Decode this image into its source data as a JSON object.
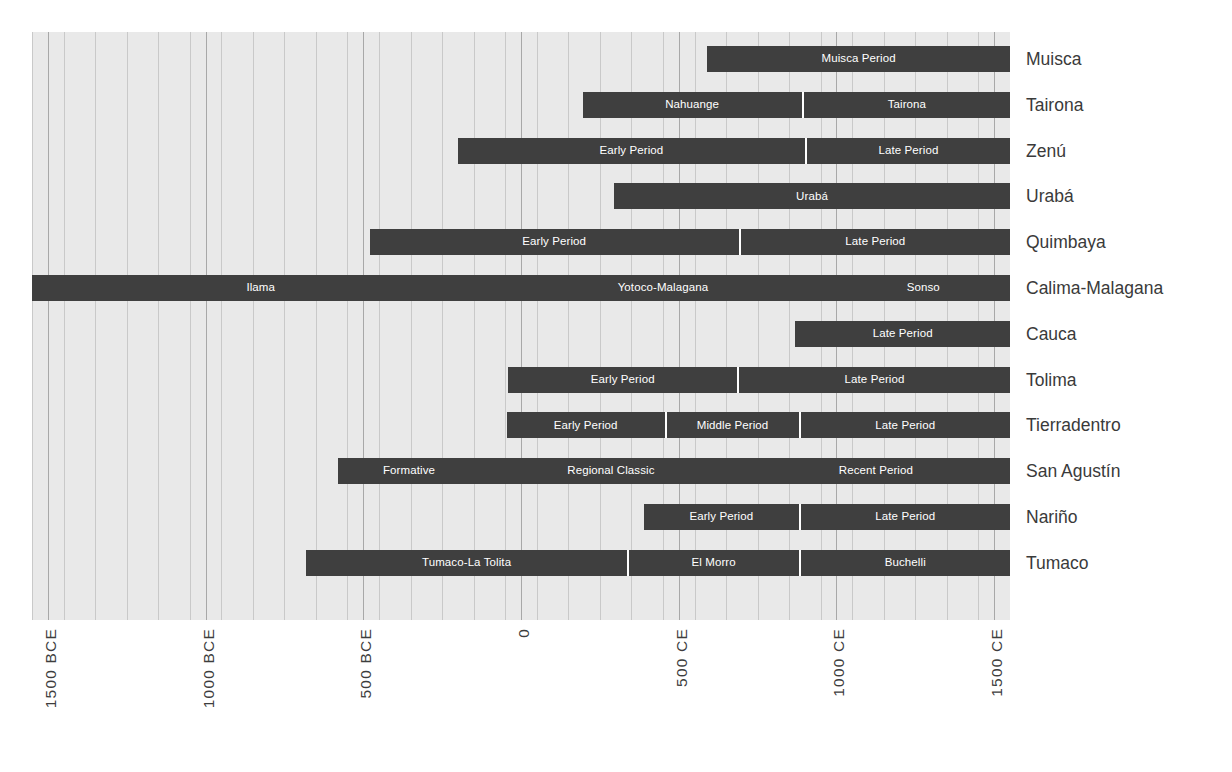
{
  "chart_data": {
    "type": "bar",
    "title": "",
    "subtitle": "",
    "xlabel": "",
    "ylabel": "",
    "orientation": "horizontal",
    "grid": true,
    "legend": "none",
    "xlim": [
      -1550,
      1550
    ],
    "x_unit": "year",
    "axis_ticks": [
      {
        "value": -1500,
        "label": "1500 BCE"
      },
      {
        "value": -1000,
        "label": "1000 BCE"
      },
      {
        "value": -500,
        "label": "500 BCE"
      },
      {
        "value": 0,
        "label": "0"
      },
      {
        "value": 500,
        "label": "500 CE"
      },
      {
        "value": 1000,
        "label": "1000 CE"
      },
      {
        "value": 1500,
        "label": "1500 CE"
      }
    ],
    "minor_gridline_step": 100,
    "colors": {
      "bar": "#3f3f3f",
      "plot_background": "#e9e9e9",
      "gridline": "#c9c9c9",
      "gridline_major": "#a8a8a8",
      "segment_divider": "#ffffff",
      "segment_label": "#ffffff",
      "category_label": "#3a3a3a",
      "page_background": "#ffffff"
    },
    "categories": [
      "Muisca",
      "Tairona",
      "Zenú",
      "Urabá",
      "Quimbaya",
      "Calima-Malagana",
      "Cauca",
      "Tolima",
      "Tierradentro",
      "San Agustín",
      "Nariño",
      "Tumaco"
    ],
    "rows": [
      {
        "category": "Muisca",
        "segments": [
          {
            "label": "Muisca Period",
            "start": 590,
            "end": 1550
          }
        ]
      },
      {
        "category": "Tairona",
        "segments": [
          {
            "label": "Nahuange",
            "start": 195,
            "end": 890
          },
          {
            "label": "Tairona",
            "start": 890,
            "end": 1550
          }
        ]
      },
      {
        "category": "Zenú",
        "segments": [
          {
            "label": "Early Period",
            "start": -200,
            "end": 900
          },
          {
            "label": "Late Period",
            "start": 900,
            "end": 1550
          }
        ]
      },
      {
        "category": "Urabá",
        "segments": [
          {
            "label": "Urabá",
            "start": 295,
            "end": 1550
          }
        ]
      },
      {
        "category": "Quimbaya",
        "segments": [
          {
            "label": "Early Period",
            "start": -480,
            "end": 690
          },
          {
            "label": "Late Period",
            "start": 690,
            "end": 1550
          }
        ]
      },
      {
        "category": "Calima-Malagana",
        "segments": [
          {
            "label": "Ilama",
            "start": -1550,
            "end": -100,
            "divider": false
          },
          {
            "label": "Yotoco-Malagana",
            "start": -100,
            "end": 1000,
            "divider": false
          },
          {
            "label": "Sonso",
            "start": 1000,
            "end": 1550,
            "divider": false
          }
        ]
      },
      {
        "category": "Cauca",
        "segments": [
          {
            "label": "Late Period",
            "start": 870,
            "end": 1550
          }
        ]
      },
      {
        "category": "Tolima",
        "segments": [
          {
            "label": "Early Period",
            "start": -40,
            "end": 685
          },
          {
            "label": "Late Period",
            "start": 685,
            "end": 1550
          }
        ]
      },
      {
        "category": "Tierradentro",
        "segments": [
          {
            "label": "Early Period",
            "start": -45,
            "end": 455
          },
          {
            "label": "Middle Period",
            "start": 455,
            "end": 880
          },
          {
            "label": "Late Period",
            "start": 880,
            "end": 1550
          }
        ]
      },
      {
        "category": "San Agustín",
        "segments": [
          {
            "label": "Formative",
            "start": -580,
            "end": -130,
            "divider": false
          },
          {
            "label": "Regional Classic",
            "start": -130,
            "end": 700,
            "divider": false
          },
          {
            "label": "Recent Period",
            "start": 700,
            "end": 1550,
            "divider": false
          }
        ]
      },
      {
        "category": "Nariño",
        "segments": [
          {
            "label": "Early Period",
            "start": 390,
            "end": 880
          },
          {
            "label": "Late Period",
            "start": 880,
            "end": 1550
          }
        ]
      },
      {
        "category": "Tumaco",
        "segments": [
          {
            "label": "Tumaco-La Tolita",
            "start": -680,
            "end": 335
          },
          {
            "label": "El  Morro",
            "start": 335,
            "end": 880
          },
          {
            "label": "Buchelli",
            "start": 880,
            "end": 1550
          }
        ]
      }
    ]
  }
}
